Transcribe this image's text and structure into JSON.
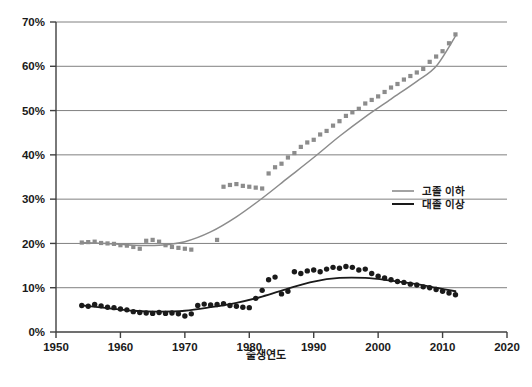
{
  "chart_data": {
    "type": "scatter",
    "title": "",
    "xlabel": "출생연도",
    "ylabel": "",
    "xlim": [
      1950,
      2020
    ],
    "ylim": [
      0,
      0.7
    ],
    "grid": true,
    "x_ticks": [
      1950,
      1960,
      1970,
      1980,
      1990,
      2000,
      2010,
      2020
    ],
    "x_tick_labels": [
      "1950",
      "1960",
      "1970",
      "1980",
      "1990",
      "2000",
      "2010",
      "2020"
    ],
    "y_ticks": [
      0,
      10,
      20,
      30,
      40,
      50,
      60,
      70
    ],
    "y_tick_labels": [
      "0%",
      "10%",
      "20%",
      "30%",
      "40%",
      "50%",
      "60%",
      "70%"
    ],
    "legend_position": "right-middle",
    "series": [
      {
        "name": "고졸 이하",
        "color": "#8c8c8c",
        "marker": "square",
        "x": [
          1954,
          1955,
          1956,
          1957,
          1958,
          1959,
          1960,
          1961,
          1962,
          1963,
          1964,
          1965,
          1966,
          1967,
          1968,
          1969,
          1970,
          1971,
          1975,
          1976,
          1977,
          1978,
          1979,
          1980,
          1981,
          1982,
          1983,
          1984,
          1985,
          1986,
          1987,
          1988,
          1989,
          1990,
          1991,
          1992,
          1993,
          1994,
          1995,
          1996,
          1997,
          1998,
          1999,
          2000,
          2001,
          2002,
          2003,
          2004,
          2005,
          2006,
          2007,
          2008,
          2009,
          2010,
          2011,
          2012
        ],
        "values": [
          20.2,
          20.3,
          20.4,
          20.1,
          20.0,
          19.9,
          19.6,
          19.5,
          19.2,
          18.8,
          20.6,
          20.8,
          20.4,
          19.6,
          19.2,
          19.0,
          18.8,
          18.6,
          20.8,
          32.8,
          33.2,
          33.4,
          33.0,
          32.8,
          32.6,
          32.4,
          35.8,
          37.2,
          38.0,
          39.4,
          40.4,
          41.8,
          42.8,
          43.4,
          44.6,
          45.4,
          46.6,
          47.6,
          48.8,
          49.6,
          50.4,
          51.6,
          52.4,
          53.2,
          54.2,
          55.2,
          56.0,
          57.0,
          57.8,
          58.6,
          59.4,
          61.0,
          62.2,
          63.4,
          65.2,
          67.2
        ]
      },
      {
        "name": "대졸 이상",
        "color": "#1a1a1a",
        "marker": "circle",
        "x": [
          1954,
          1955,
          1956,
          1957,
          1958,
          1959,
          1960,
          1961,
          1962,
          1963,
          1964,
          1965,
          1966,
          1967,
          1968,
          1969,
          1970,
          1971,
          1972,
          1973,
          1974,
          1975,
          1976,
          1977,
          1978,
          1979,
          1980,
          1981,
          1982,
          1983,
          1984,
          1985,
          1986,
          1987,
          1988,
          1989,
          1990,
          1991,
          1992,
          1993,
          1994,
          1995,
          1996,
          1997,
          1998,
          1999,
          2000,
          2001,
          2002,
          2003,
          2004,
          2005,
          2006,
          2007,
          2008,
          2009,
          2010,
          2011,
          2012
        ],
        "values": [
          6.0,
          5.8,
          6.2,
          5.9,
          5.6,
          5.5,
          5.2,
          5.0,
          4.6,
          4.4,
          4.3,
          4.2,
          4.4,
          4.2,
          4.3,
          4.1,
          3.6,
          4.1,
          6.0,
          6.3,
          6.1,
          6.2,
          6.4,
          6.0,
          5.8,
          5.6,
          5.5,
          7.6,
          9.4,
          11.8,
          12.4,
          8.6,
          9.2,
          13.6,
          13.2,
          13.8,
          14.0,
          13.6,
          14.2,
          14.6,
          14.4,
          14.8,
          14.6,
          14.0,
          14.2,
          13.2,
          12.6,
          12.2,
          11.8,
          11.4,
          11.2,
          10.8,
          10.6,
          10.2,
          10.0,
          9.6,
          9.2,
          8.8,
          8.4
        ]
      }
    ],
    "trend_lines": [
      {
        "name": "고졸 이하",
        "color": "#8c8c8c",
        "points": [
          [
            1954,
            20.2
          ],
          [
            1958,
            20.0
          ],
          [
            1962,
            19.6
          ],
          [
            1966,
            19.6
          ],
          [
            1970,
            20.4
          ],
          [
            1974,
            22.6
          ],
          [
            1978,
            26.0
          ],
          [
            1982,
            30.2
          ],
          [
            1986,
            34.8
          ],
          [
            1990,
            39.4
          ],
          [
            1994,
            44.2
          ],
          [
            1998,
            48.6
          ],
          [
            2002,
            52.6
          ],
          [
            2006,
            56.6
          ],
          [
            2009,
            60.0
          ],
          [
            2012,
            66.8
          ]
        ]
      },
      {
        "name": "대졸 이상",
        "color": "#1a1a1a",
        "points": [
          [
            1954,
            6.0
          ],
          [
            1958,
            5.4
          ],
          [
            1962,
            4.8
          ],
          [
            1966,
            4.6
          ],
          [
            1970,
            4.8
          ],
          [
            1974,
            5.6
          ],
          [
            1978,
            6.6
          ],
          [
            1982,
            8.0
          ],
          [
            1986,
            9.8
          ],
          [
            1990,
            11.4
          ],
          [
            1994,
            12.2
          ],
          [
            1998,
            12.2
          ],
          [
            2002,
            11.6
          ],
          [
            2006,
            10.8
          ],
          [
            2009,
            10.0
          ],
          [
            2012,
            9.2
          ]
        ]
      }
    ]
  },
  "legend": {
    "items": [
      {
        "label": "고졸 이하",
        "color": "#8c8c8c"
      },
      {
        "label": "대졸 이상",
        "color": "#1a1a1a"
      }
    ]
  },
  "axis": {
    "x_title": "출생연도"
  },
  "colors": {
    "series_gray": "#8c8c8c",
    "series_black": "#1a1a1a",
    "gridline": "#808080",
    "axis": "#404040",
    "background": "#ffffff"
  }
}
